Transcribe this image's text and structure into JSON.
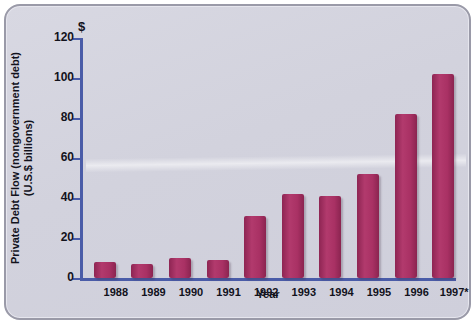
{
  "chart_data": {
    "type": "bar",
    "title": "",
    "subtitle": "",
    "xlabel": "Year",
    "ylabel": "Private Debt Flow (nongovernment debt) (U.S.$ billions)",
    "currency_symbol": "$",
    "categories": [
      "1988",
      "1989",
      "1990",
      "1991",
      "1992",
      "1993",
      "1994",
      "1995",
      "1996",
      "1997*"
    ],
    "values": [
      8,
      7,
      10,
      9,
      31,
      42,
      41,
      52,
      82,
      102
    ],
    "ylim": [
      0,
      120
    ],
    "yticks": [
      0,
      20,
      40,
      60,
      80,
      100,
      120
    ],
    "ytick_labels": [
      "0",
      "20",
      "40",
      "60",
      "80",
      "100",
      "120"
    ],
    "grid": false,
    "legend": null,
    "series": [
      {
        "name": "Private Debt Flow",
        "values": [
          8,
          7,
          10,
          9,
          31,
          42,
          41,
          52,
          82,
          102
        ]
      }
    ],
    "colors": {
      "bar": "#a93164",
      "bar_dark": "#8b2450",
      "bar_light": "#b23a6d",
      "axis": "#4a5ca8",
      "text": "#12121c",
      "panel_background": "#d4d4df",
      "panel_border": "#9a9aa8"
    }
  }
}
